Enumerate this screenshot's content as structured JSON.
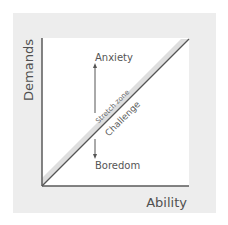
{
  "diagram": {
    "type": "flow-channel-diagram",
    "axes": {
      "x_label": "Ability",
      "y_label": "Demands"
    },
    "regions": {
      "upper": "Anxiety",
      "lower": "Boredom"
    },
    "diagonal": {
      "above_line_label": "Stretch zone",
      "below_line_label": "Challenge"
    },
    "colors": {
      "panel_background": "#ededed",
      "plot_background": "#ffffff",
      "line": "#555555",
      "stretch_band": "#dcdcdc",
      "text": "#555555"
    }
  }
}
